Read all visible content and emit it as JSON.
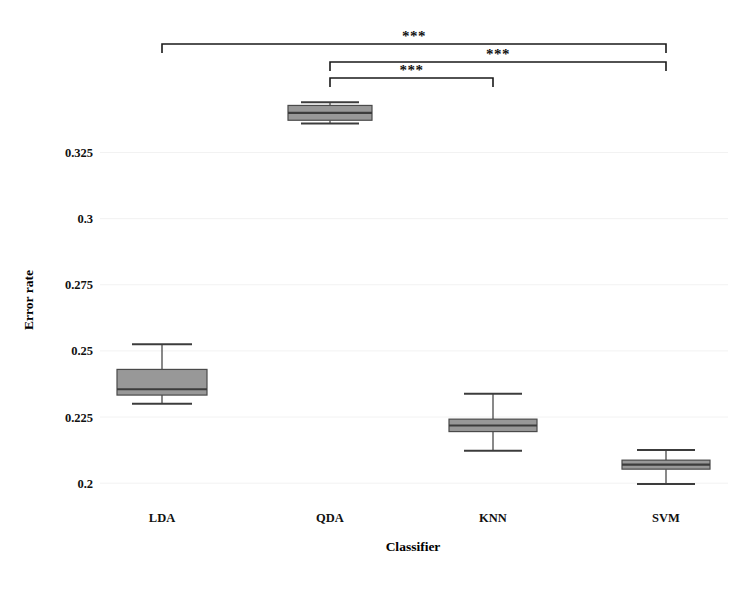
{
  "chart_data": {
    "type": "box",
    "title": "",
    "xlabel": "Classifier",
    "ylabel": "Error rate",
    "categories": [
      "LDA",
      "QDA",
      "KNN",
      "SVM"
    ],
    "ytick_labels": [
      "0.325",
      "0.3",
      "0.275",
      "0.25",
      "0.225",
      "0.2"
    ],
    "ytick_values": [
      0.325,
      0.3,
      0.275,
      0.25,
      0.225,
      0.2
    ],
    "ylim": [
      0.1925,
      0.3475
    ],
    "grid": true,
    "legend": "none",
    "boxes": [
      {
        "category": "LDA",
        "whisker_low": 0.23,
        "q1": 0.2333,
        "median": 0.2355,
        "q3": 0.243,
        "whisker_high": 0.2525
      },
      {
        "category": "QDA",
        "whisker_low": 0.336,
        "q1": 0.3372,
        "median": 0.34,
        "q3": 0.3428,
        "whisker_high": 0.344
      },
      {
        "category": "KNN",
        "whisker_low": 0.2123,
        "q1": 0.2195,
        "median": 0.2218,
        "q3": 0.2242,
        "whisker_high": 0.2338
      },
      {
        "category": "SVM",
        "whisker_low": 0.1997,
        "q1": 0.2053,
        "median": 0.207,
        "q3": 0.2087,
        "whisker_high": 0.2125
      }
    ],
    "significance": [
      {
        "from": "LDA",
        "to": "SVM",
        "label": "***",
        "level": 0
      },
      {
        "from": "QDA",
        "to": "SVM",
        "label": "***",
        "level": 1
      },
      {
        "from": "QDA",
        "to": "KNN",
        "label": "***",
        "level": 2
      }
    ],
    "colors": {
      "box_fill": "#989898",
      "box_edge": "#4a4a4a",
      "median": "#3c3c3c",
      "whisker": "#4a4a4a",
      "grid": "#f2f2f2",
      "background": "#ffffff",
      "text": "#111111",
      "bracket": "#1a1a1a"
    }
  }
}
